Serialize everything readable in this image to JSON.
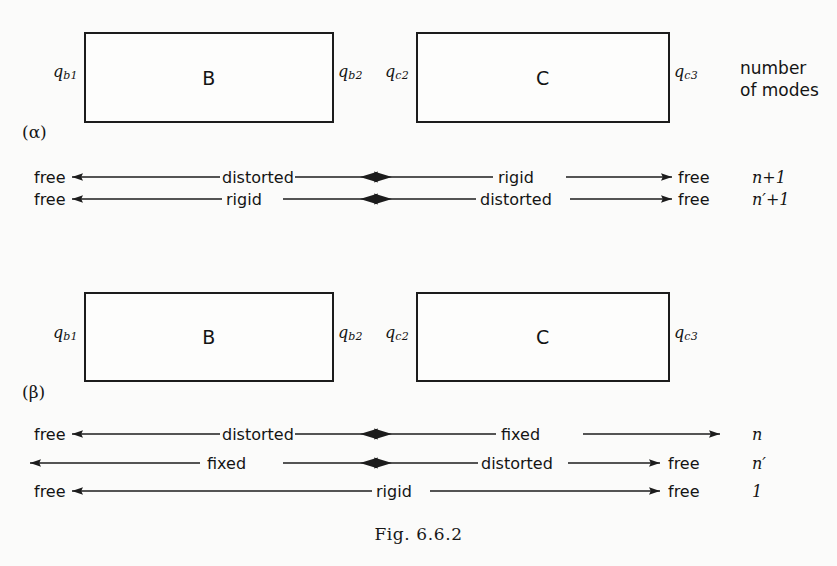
{
  "figure": {
    "caption": "Fig. 6.6.2",
    "modes_header": "number\nof modes"
  },
  "sections": [
    {
      "id": "alpha",
      "label": "(α)",
      "boxes": [
        {
          "name": "B",
          "label": "B",
          "left_port": "q",
          "left_port_sub": "b1",
          "right_port": "q",
          "right_port_sub": "b2"
        },
        {
          "name": "C",
          "label": "C",
          "left_port": "q",
          "left_port_sub": "c2",
          "right_port": "q",
          "right_port_sub": "c3"
        }
      ],
      "rows": [
        {
          "start_label": "free",
          "left_segment_label": "distorted",
          "right_segment_label": "rigid",
          "end_label": "free",
          "count": "n+1"
        },
        {
          "start_label": "free",
          "left_segment_label": "rigid",
          "right_segment_label": "distorted",
          "end_label": "free",
          "count": "n′+1"
        }
      ]
    },
    {
      "id": "beta",
      "label": "(β)",
      "boxes": [
        {
          "name": "B",
          "label": "B",
          "left_port": "q",
          "left_port_sub": "b1",
          "right_port": "q",
          "right_port_sub": "b2"
        },
        {
          "name": "C",
          "label": "C",
          "left_port": "q",
          "left_port_sub": "c2",
          "right_port": "q",
          "right_port_sub": "c3"
        }
      ],
      "rows": [
        {
          "start_label": "free",
          "left_segment_label": "distorted",
          "right_segment_label": "fixed",
          "end_label": "",
          "count": "n"
        },
        {
          "start_label": "",
          "left_segment_label": "fixed",
          "right_segment_label": "distorted",
          "end_label": "free",
          "count": "n′"
        },
        {
          "start_label": "free",
          "left_segment_label": "",
          "right_segment_label": "rigid",
          "end_label": "free",
          "count": "1"
        }
      ]
    }
  ],
  "colors": {
    "ink": "#1c1c1c",
    "paper": "#fbfbfa"
  }
}
